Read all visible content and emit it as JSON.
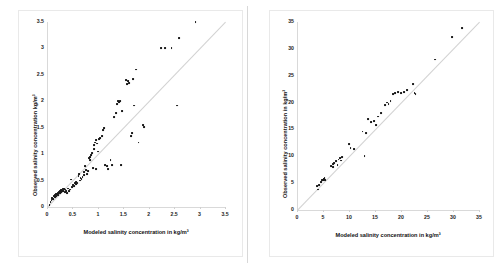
{
  "figure": {
    "background": "#ffffff",
    "marker_color": "#1a1a1a",
    "line_color": "#d2d2d2",
    "axis_color": "#d9d9d9"
  },
  "chart_data": [
    {
      "type": "scatter",
      "panel": "left",
      "title": "",
      "xlabel": "Modeled salinity concentration in kg/m³",
      "ylabel": "Observed salinity concentration kg/m³",
      "xlim": [
        0,
        3.5
      ],
      "ylim": [
        0,
        3.5
      ],
      "xticks": [
        0,
        0.5,
        1,
        1.5,
        2,
        2.5,
        3,
        3.5
      ],
      "yticks": [
        0,
        0.5,
        1,
        1.5,
        2,
        2.5,
        3,
        3.5
      ],
      "xticklabels": [
        "0",
        "0.5",
        "1",
        "1.5",
        "2",
        "2.5",
        "3",
        "3.5"
      ],
      "yticklabels": [
        "0",
        "0.5",
        "1",
        "1.5",
        "2",
        "2.5",
        "3",
        "3.5"
      ],
      "grid": false,
      "legend": false,
      "reference_line": {
        "type": "1:1",
        "from": [
          0,
          0
        ],
        "to": [
          3.5,
          3.5
        ]
      },
      "points": [
        [
          0.05,
          0.03
        ],
        [
          0.07,
          0.1
        ],
        [
          0.09,
          0.13
        ],
        [
          0.1,
          0.17
        ],
        [
          0.12,
          0.15
        ],
        [
          0.13,
          0.2
        ],
        [
          0.15,
          0.18
        ],
        [
          0.16,
          0.22
        ],
        [
          0.17,
          0.25
        ],
        [
          0.18,
          0.21
        ],
        [
          0.2,
          0.24
        ],
        [
          0.21,
          0.27
        ],
        [
          0.22,
          0.23
        ],
        [
          0.24,
          0.28
        ],
        [
          0.25,
          0.3
        ],
        [
          0.26,
          0.26
        ],
        [
          0.27,
          0.32
        ],
        [
          0.28,
          0.29
        ],
        [
          0.29,
          0.33
        ],
        [
          0.3,
          0.31
        ],
        [
          0.31,
          0.35
        ],
        [
          0.32,
          0.3
        ],
        [
          0.33,
          0.34
        ],
        [
          0.35,
          0.28
        ],
        [
          0.36,
          0.33
        ],
        [
          0.38,
          0.31
        ],
        [
          0.4,
          0.27
        ],
        [
          0.42,
          0.35
        ],
        [
          0.44,
          0.3
        ],
        [
          0.46,
          0.33
        ],
        [
          0.48,
          0.52
        ],
        [
          0.5,
          0.38
        ],
        [
          0.52,
          0.42
        ],
        [
          0.54,
          0.4
        ],
        [
          0.55,
          0.45
        ],
        [
          0.57,
          0.44
        ],
        [
          0.58,
          0.48
        ],
        [
          0.6,
          0.46
        ],
        [
          0.62,
          0.58
        ],
        [
          0.63,
          0.63
        ],
        [
          0.65,
          0.5
        ],
        [
          0.66,
          0.55
        ],
        [
          0.68,
          0.53
        ],
        [
          0.7,
          0.57
        ],
        [
          0.72,
          0.6
        ],
        [
          0.73,
          0.66
        ],
        [
          0.75,
          0.78
        ],
        [
          0.76,
          0.7
        ],
        [
          0.78,
          0.62
        ],
        [
          0.8,
          0.68
        ],
        [
          0.82,
          0.93
        ],
        [
          0.84,
          0.88
        ],
        [
          0.85,
          0.95
        ],
        [
          0.87,
          0.98
        ],
        [
          0.88,
          1.02
        ],
        [
          0.9,
          0.74
        ],
        [
          0.92,
          1.1
        ],
        [
          0.93,
          1.18
        ],
        [
          0.95,
          1.22
        ],
        [
          0.96,
          1.26
        ],
        [
          0.97,
          0.72
        ],
        [
          0.98,
          1.2
        ],
        [
          1.0,
          1.05
        ],
        [
          1.02,
          1.28
        ],
        [
          1.05,
          1.3
        ],
        [
          1.08,
          1.35
        ],
        [
          1.1,
          1.45
        ],
        [
          1.12,
          1.5
        ],
        [
          1.15,
          0.8
        ],
        [
          1.18,
          0.78
        ],
        [
          1.2,
          0.72
        ],
        [
          1.25,
          0.88
        ],
        [
          1.28,
          0.8
        ],
        [
          1.32,
          1.7
        ],
        [
          1.35,
          1.78
        ],
        [
          1.38,
          1.95
        ],
        [
          1.4,
          2.0
        ],
        [
          1.42,
          1.98
        ],
        [
          1.44,
          2.0
        ],
        [
          1.46,
          0.8
        ],
        [
          1.48,
          1.82
        ],
        [
          1.55,
          2.4
        ],
        [
          1.58,
          2.32
        ],
        [
          1.6,
          2.38
        ],
        [
          1.62,
          2.35
        ],
        [
          1.65,
          1.35
        ],
        [
          1.68,
          1.4
        ],
        [
          1.7,
          2.42
        ],
        [
          1.72,
          1.92
        ],
        [
          1.75,
          2.6
        ],
        [
          1.8,
          1.22
        ],
        [
          1.88,
          1.55
        ],
        [
          1.9,
          1.52
        ],
        [
          2.25,
          3.0
        ],
        [
          2.32,
          3.0
        ],
        [
          2.45,
          3.0
        ],
        [
          2.55,
          1.92
        ],
        [
          2.6,
          3.2
        ],
        [
          2.92,
          3.5
        ]
      ]
    },
    {
      "type": "scatter",
      "panel": "right",
      "title": "",
      "xlabel": "Modeled salinity concentration in kg/m³",
      "ylabel": "Observed salinity concentration in kg/m³",
      "xlim": [
        0,
        35
      ],
      "ylim": [
        0,
        35
      ],
      "xticks": [
        0,
        5,
        10,
        15,
        20,
        25,
        30,
        35
      ],
      "yticks": [
        0,
        5,
        10,
        15,
        20,
        25,
        30,
        35
      ],
      "xticklabels": [
        "0",
        "5",
        "10",
        "15",
        "20",
        "25",
        "30",
        "35"
      ],
      "yticklabels": [
        "0",
        "5",
        "10",
        "15",
        "20",
        "25",
        "30",
        "35"
      ],
      "grid": false,
      "legend": false,
      "reference_line": {
        "type": "1:1",
        "from": [
          0,
          0
        ],
        "to": [
          35,
          35
        ]
      },
      "points": [
        [
          3.8,
          4.5
        ],
        [
          4.0,
          3.8
        ],
        [
          4.2,
          4.6
        ],
        [
          4.6,
          5.2
        ],
        [
          4.8,
          5.5
        ],
        [
          5.0,
          5.6
        ],
        [
          5.1,
          5.8
        ],
        [
          5.2,
          5.7
        ],
        [
          5.3,
          5.9
        ],
        [
          5.4,
          5.5
        ],
        [
          6.6,
          8.2
        ],
        [
          6.9,
          8.6
        ],
        [
          7.0,
          8.0
        ],
        [
          7.2,
          8.8
        ],
        [
          7.5,
          9.1
        ],
        [
          7.8,
          8.4
        ],
        [
          8.0,
          9.4
        ],
        [
          8.2,
          9.7
        ],
        [
          8.4,
          9.2
        ],
        [
          8.6,
          9.8
        ],
        [
          10.0,
          12.3
        ],
        [
          10.3,
          11.6
        ],
        [
          11.0,
          11.3
        ],
        [
          12.6,
          14.6
        ],
        [
          13.0,
          10.0
        ],
        [
          13.3,
          14.3
        ],
        [
          13.6,
          17.0
        ],
        [
          14.2,
          16.3
        ],
        [
          14.8,
          16.5
        ],
        [
          15.2,
          15.8
        ],
        [
          15.6,
          17.4
        ],
        [
          16.2,
          18.0
        ],
        [
          17.0,
          19.6
        ],
        [
          17.4,
          20.0
        ],
        [
          17.6,
          19.8
        ],
        [
          18.0,
          20.3
        ],
        [
          18.4,
          21.6
        ],
        [
          18.8,
          21.8
        ],
        [
          19.4,
          21.9
        ],
        [
          20.0,
          21.8
        ],
        [
          20.6,
          22.0
        ],
        [
          21.2,
          22.4
        ],
        [
          22.4,
          23.4
        ],
        [
          22.6,
          21.8
        ],
        [
          22.8,
          21.6
        ],
        [
          26.5,
          28.0
        ],
        [
          29.9,
          32.2
        ],
        [
          31.8,
          33.8
        ]
      ]
    }
  ]
}
